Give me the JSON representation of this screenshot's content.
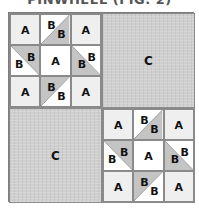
{
  "title": "PINWHEEL (FIG. 2)",
  "colors": {
    "corner_a": "#efefef",
    "center_a": "#ffffff",
    "triangle_grey": "#c4c4c4",
    "triangle_white": "#ffffff",
    "c_fill": "#cfcfcf",
    "grid_line": "#8a8a8a"
  },
  "blocks": {
    "top_left": {
      "type": "pinwheel",
      "cells": {
        "r0c0": "A",
        "r0c1_a": "B",
        "r0c1_b": "B",
        "r0c2": "A",
        "r1c0_a": "B",
        "r1c0_b": "B",
        "r1c1": "A",
        "r1c2_a": "B",
        "r1c2_b": "B",
        "r2c0": "A",
        "r2c1_a": "B",
        "r2c1_b": "B",
        "r2c2": "A"
      }
    },
    "top_right": {
      "type": "solid",
      "label": "C"
    },
    "bottom_left": {
      "type": "solid",
      "label": "C"
    },
    "bottom_right": {
      "type": "pinwheel",
      "cells": {
        "r0c0": "A",
        "r0c1_a": "B",
        "r0c1_b": "B",
        "r0c2": "A",
        "r1c0_a": "B",
        "r1c0_b": "B",
        "r1c1": "A",
        "r1c2_a": "B",
        "r1c2_b": "B",
        "r2c0": "A",
        "r2c1_a": "B",
        "r2c1_b": "B",
        "r2c2": "A"
      }
    }
  }
}
